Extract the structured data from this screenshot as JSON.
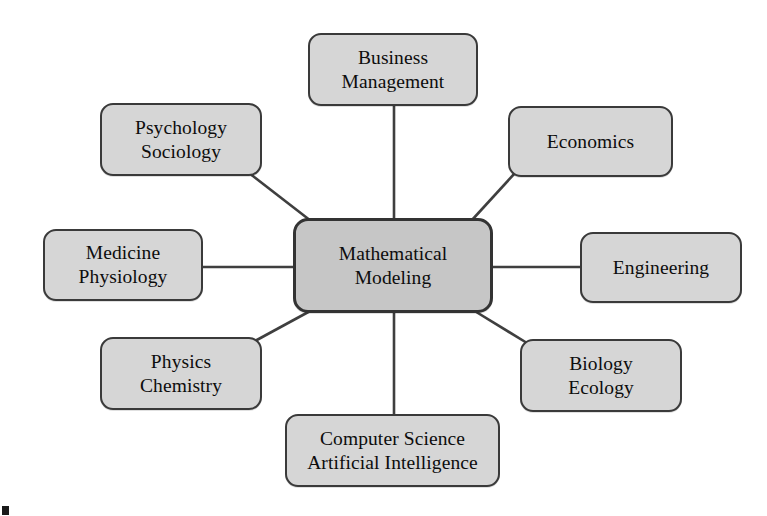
{
  "diagram": {
    "type": "hub-and-spoke",
    "center": {
      "id": "mathematical-modeling",
      "lines": [
        "Mathematical",
        "Modeling"
      ],
      "x": 293,
      "y": 218,
      "width": 200,
      "height": 95
    },
    "colors": {
      "center_fill": "#c6c6c6",
      "node_fill": "#d6d6d6",
      "border": "#3a3a3a",
      "connector": "#3f3f3f",
      "text": "#0d0d0d",
      "background": "#ffffff"
    },
    "nodes": [
      {
        "id": "business-management",
        "lines": [
          "Business",
          "Management"
        ],
        "x": 308,
        "y": 33,
        "width": 170,
        "height": 73,
        "font_size": 19.5
      },
      {
        "id": "psychology-sociology",
        "lines": [
          "Psychology",
          "Sociology"
        ],
        "x": 100,
        "y": 103,
        "width": 162,
        "height": 73,
        "font_size": 19.5
      },
      {
        "id": "economics",
        "lines": [
          "Economics"
        ],
        "x": 508,
        "y": 106,
        "width": 165,
        "height": 71,
        "font_size": 19.5
      },
      {
        "id": "medicine-physiology",
        "lines": [
          "Medicine",
          "Physiology"
        ],
        "x": 43,
        "y": 229,
        "width": 160,
        "height": 72,
        "font_size": 19.5
      },
      {
        "id": "engineering",
        "lines": [
          "Engineering"
        ],
        "x": 580,
        "y": 232,
        "width": 162,
        "height": 71,
        "font_size": 19.5
      },
      {
        "id": "physics-chemistry",
        "lines": [
          "Physics",
          "Chemistry"
        ],
        "x": 100,
        "y": 337,
        "width": 162,
        "height": 73,
        "font_size": 19.5
      },
      {
        "id": "biology-ecology",
        "lines": [
          "Biology",
          "Ecology"
        ],
        "x": 520,
        "y": 339,
        "width": 162,
        "height": 73,
        "font_size": 19.5
      },
      {
        "id": "computer-science-ai",
        "lines": [
          "Computer Science",
          "Artificial Intelligence"
        ],
        "x": 285,
        "y": 414,
        "width": 215,
        "height": 73,
        "font_size": 19.5
      }
    ],
    "connectors": [
      {
        "id": "edge-center-business-management",
        "x1": 394,
        "y1": 106,
        "x2": 394,
        "y2": 218
      },
      {
        "id": "edge-center-psychology-sociology",
        "x1": 249,
        "y1": 173,
        "x2": 311,
        "y2": 221
      },
      {
        "id": "edge-center-economics",
        "x1": 515,
        "y1": 173,
        "x2": 472,
        "y2": 220
      },
      {
        "id": "edge-center-medicine-physiology",
        "x1": 203,
        "y1": 267,
        "x2": 293,
        "y2": 267
      },
      {
        "id": "edge-center-engineering",
        "x1": 493,
        "y1": 267,
        "x2": 580,
        "y2": 267
      },
      {
        "id": "edge-center-physics-chemistry",
        "x1": 255,
        "y1": 341,
        "x2": 312,
        "y2": 310
      },
      {
        "id": "edge-center-biology-ecology",
        "x1": 527,
        "y1": 343,
        "x2": 473,
        "y2": 310
      },
      {
        "id": "edge-center-computer-science-ai",
        "x1": 394,
        "y1": 313,
        "x2": 394,
        "y2": 414
      }
    ]
  }
}
